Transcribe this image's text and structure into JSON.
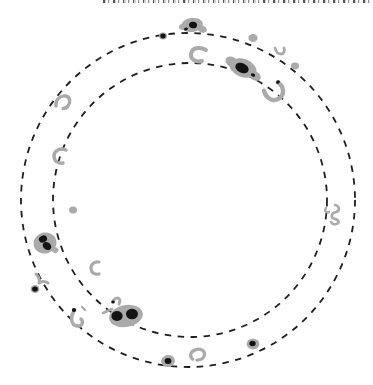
{
  "figure": {
    "canvas": {
      "width": 373,
      "height": 385
    },
    "background": "#ffffff",
    "colors": {
      "spot_gray": "#aaaaaa",
      "spot_dark": "#131313",
      "circle_line": "#1e1e1e"
    },
    "circles": [
      {
        "name": "outer-dashed-circle",
        "cx": 188,
        "cy": 200,
        "r": 167,
        "dash": "6.5 6.5",
        "stroke_width": 1.8
      },
      {
        "name": "inner-dashed-circle",
        "cx": 190,
        "cy": 200,
        "r": 137,
        "dash": "6.5 6.5",
        "stroke_width": 1.8
      }
    ],
    "spots": [
      {
        "name": "spot-top-center-group",
        "kind": "group",
        "cx": 192,
        "cy": 25,
        "parts": [
          {
            "type": "ellipse",
            "fill": "gray",
            "rx": 11,
            "ry": 7,
            "rot": -8
          },
          {
            "type": "ellipse",
            "fill": "gray",
            "rx": 5,
            "ry": 3.5,
            "dx": 10,
            "dy": 4,
            "rot": 20
          },
          {
            "type": "ellipse",
            "fill": "gray",
            "rx": 4,
            "ry": 3,
            "dx": -9,
            "dy": 2
          },
          {
            "type": "ellipse",
            "fill": "dark",
            "rx": 4,
            "ry": 3.3,
            "dx": 1,
            "rot": 10
          },
          {
            "type": "ellipse",
            "fill": "dark",
            "rx": 2,
            "ry": 1.4,
            "dx": -6,
            "dy": 4,
            "rot": -20
          }
        ]
      },
      {
        "name": "spot-dark-dot-upper-left",
        "kind": "dark-dot",
        "cx": 163,
        "cy": 36,
        "parts": [
          {
            "type": "ellipse",
            "fill": "gray",
            "rx": 4,
            "ry": 3.6
          },
          {
            "type": "ellipse",
            "fill": "dark",
            "rx": 2.7,
            "ry": 2.4
          }
        ]
      },
      {
        "name": "spot-gray-dot-upper-right",
        "kind": "gray-dot",
        "cx": 253,
        "cy": 38,
        "parts": [
          {
            "type": "ellipse",
            "fill": "gray",
            "rx": 4.6,
            "ry": 4
          }
        ]
      },
      {
        "name": "spot-beak-top-center",
        "kind": "crescent",
        "cx": 198,
        "cy": 55,
        "parts": [
          {
            "type": "path",
            "stroke": "gray",
            "sw": 4,
            "d": "M 8,-5 C 1,-9 -6,-7 -7,-1 C -8,4 -2,8 4,6"
          }
        ]
      },
      {
        "name": "spot-large-group-upper-right",
        "kind": "group",
        "cx": 243,
        "cy": 68,
        "parts": [
          {
            "type": "ellipse",
            "fill": "gray",
            "rx": 14,
            "ry": 9,
            "rot": 20
          },
          {
            "type": "ellipse",
            "fill": "gray",
            "rx": 7,
            "ry": 5,
            "dx": -11,
            "dy": -6,
            "rot": 30
          },
          {
            "type": "ellipse",
            "fill": "gray",
            "rx": 6,
            "ry": 4.5,
            "dx": 12,
            "dy": 8,
            "rot": 25
          },
          {
            "type": "ellipse",
            "fill": "dark",
            "rx": 7,
            "ry": 4.8,
            "dx": -1,
            "rot": 25
          },
          {
            "type": "ellipse",
            "fill": "dark",
            "rx": 2.2,
            "ry": 1.6,
            "dx": 10,
            "dy": 7,
            "rot": 25
          }
        ]
      },
      {
        "name": "spot-fork-upper-right",
        "kind": "arc",
        "cx": 280,
        "cy": 52,
        "parts": [
          {
            "type": "path",
            "stroke": "gray",
            "sw": 2.8,
            "d": "M -5,-4 C -4,0 -2,2 1,2 C 4,2 5,-1 4,-4"
          }
        ]
      },
      {
        "name": "spot-gray-dot-right-upper",
        "kind": "gray-dot",
        "cx": 295,
        "cy": 66,
        "parts": [
          {
            "type": "ellipse",
            "fill": "gray",
            "rx": 4,
            "ry": 3.4
          }
        ]
      },
      {
        "name": "spot-horseshoe-upper-right",
        "kind": "horseshoe",
        "cx": 274,
        "cy": 91,
        "parts": [
          {
            "type": "path",
            "stroke": "gray",
            "sw": 4.4,
            "rot": -35,
            "d": "M -8,-6 C -11,2 -7,9 0,9 C 7,9 11,2 8,-5"
          },
          {
            "type": "ellipse",
            "fill": "dark",
            "rx": 2,
            "ry": 1.5,
            "dx": 4,
            "dy": -9,
            "rot": -35
          }
        ]
      },
      {
        "name": "spot-hook-left-upper",
        "kind": "arc",
        "cx": 63,
        "cy": 103,
        "parts": [
          {
            "type": "path",
            "stroke": "gray",
            "sw": 3.4,
            "d": "M -7,3 C -8,-3 -3,-8 3,-7 C 7,-6 8,-1 5,3 C 4,4.5 2,5.5 0,5.5"
          }
        ]
      },
      {
        "name": "spot-c-left-middle",
        "kind": "arc",
        "cx": 60,
        "cy": 156,
        "parts": [
          {
            "type": "path",
            "stroke": "gray",
            "sw": 3.4,
            "d": "M 6,-6 C 0,-9 -6,-5 -6,0 C -6,5 -2,8 3,7"
          }
        ]
      },
      {
        "name": "spot-gray-dot-left",
        "kind": "gray-dot",
        "cx": 73,
        "cy": 210,
        "parts": [
          {
            "type": "ellipse",
            "fill": "gray",
            "rx": 4,
            "ry": 3.5
          }
        ]
      },
      {
        "name": "spot-large-group-left",
        "kind": "group",
        "cx": 45,
        "cy": 243,
        "parts": [
          {
            "type": "ellipse",
            "fill": "gray",
            "rx": 11.5,
            "ry": 10.5,
            "rot": -15
          },
          {
            "type": "ellipse",
            "fill": "gray",
            "rx": 3.5,
            "ry": 2.8,
            "dx": 10,
            "dy": 7,
            "rot": 20
          },
          {
            "type": "ellipse",
            "fill": "dark",
            "rx": 4.2,
            "ry": 3.4,
            "dx": -2,
            "dy": -4,
            "rot": -25
          },
          {
            "type": "ellipse",
            "fill": "dark",
            "rx": 4.6,
            "ry": 3.6,
            "dx": 2,
            "dy": 3,
            "rot": 35
          }
        ]
      },
      {
        "name": "spot-check-left-lower",
        "kind": "arc",
        "cx": 42,
        "cy": 279,
        "parts": [
          {
            "type": "path",
            "stroke": "gray",
            "sw": 3,
            "d": "M -6,-5 C -3,-2 -2,1 -3,4 C 0,2 3,2 6,4"
          }
        ]
      },
      {
        "name": "spot-dark-dot-left-lower",
        "kind": "dark-dot",
        "cx": 35,
        "cy": 289,
        "parts": [
          {
            "type": "ellipse",
            "fill": "gray",
            "rx": 4.4,
            "ry": 4
          },
          {
            "type": "ellipse",
            "fill": "dark",
            "rx": 2.9,
            "ry": 2.6
          }
        ]
      },
      {
        "name": "spot-crescent-lower-left",
        "kind": "arc",
        "cx": 95,
        "cy": 268,
        "parts": [
          {
            "type": "path",
            "stroke": "gray",
            "sw": 3.2,
            "d": "M 4,-6 C -1,-7 -4.5,-3 -4,1 C -3.5,5 0,7 4,6"
          }
        ]
      },
      {
        "name": "spot-squiggle-right",
        "kind": "squiggle",
        "cx": 334,
        "cy": 216,
        "parts": [
          {
            "type": "path",
            "stroke": "gray",
            "sw": 2.6,
            "d": "M 1,-11 C 6,-10 6,-5 2,-4 C -3,-3 -4,2 1,3 C 5,4 6,7 2,8 C 0,8.5 -2,8 -3,6"
          },
          {
            "type": "path",
            "stroke": "gray",
            "sw": 2.4,
            "d": "M -8,-8 C -10,-5 -8,-3 -5,-4"
          }
        ]
      },
      {
        "name": "spot-large-group-bottom",
        "kind": "group",
        "cx": 126,
        "cy": 316,
        "parts": [
          {
            "type": "ellipse",
            "fill": "gray",
            "rx": 17,
            "ry": 11,
            "rot": -10
          },
          {
            "type": "ellipse",
            "fill": "dark",
            "rx": 5.6,
            "ry": 5,
            "dx": -9
          },
          {
            "type": "ellipse",
            "fill": "dark",
            "rx": 6,
            "ry": 5.2,
            "dx": 6,
            "dy": -2
          },
          {
            "type": "path",
            "stroke": "gray",
            "sw": 3,
            "d": "M -13,-15 C -9,-20 -4,-18 -7,-12"
          },
          {
            "type": "path",
            "stroke": "gray",
            "sw": 2.6,
            "d": "M -23,-3 L -14,-7"
          },
          {
            "type": "ellipse",
            "fill": "dark",
            "rx": 1.8,
            "ry": 1.5,
            "dx": -13,
            "dy": -14
          }
        ]
      },
      {
        "name": "spot-dot-group-bottom-center",
        "kind": "dark-dot",
        "cx": 168,
        "cy": 361,
        "parts": [
          {
            "type": "ellipse",
            "fill": "gray",
            "rx": 7,
            "ry": 6,
            "rot": -10
          },
          {
            "type": "ellipse",
            "fill": "dark",
            "rx": 3.4,
            "ry": 3
          }
        ]
      },
      {
        "name": "spot-ring-bottom-center",
        "kind": "ring",
        "cx": 197,
        "cy": 355,
        "parts": [
          {
            "type": "path",
            "stroke": "gray",
            "sw": 3.2,
            "rot": -10,
            "d": "M -5,3.5 C -8,0 -6,-5 0,-5.5 C 6,-6 9,-2 7,2 C 5.5,4.5 2,5.5 -1,5"
          }
        ]
      },
      {
        "name": "spot-dot-bottom-right",
        "kind": "dark-dot",
        "cx": 253,
        "cy": 344,
        "parts": [
          {
            "type": "ellipse",
            "fill": "gray",
            "rx": 6.4,
            "ry": 5.4
          },
          {
            "type": "ellipse",
            "fill": "dark",
            "rx": 3.2,
            "ry": 2.7,
            "dx": -0.5,
            "dy": -0.5
          }
        ]
      },
      {
        "name": "spot-hook-bottom-left",
        "kind": "hook",
        "cx": 77,
        "cy": 320,
        "parts": [
          {
            "type": "path",
            "stroke": "gray",
            "sw": 3.4,
            "d": "M -3,-9 C -7,-3 -6,5 0,6 C 5,7 7,2 4,-1"
          },
          {
            "type": "ellipse",
            "fill": "dark",
            "rx": 2.2,
            "ry": 2,
            "dx": -3,
            "dy": -10
          },
          {
            "type": "path",
            "stroke": "gray",
            "sw": 2.4,
            "d": "M 5,-13 L 8,-10"
          }
        ]
      }
    ]
  }
}
